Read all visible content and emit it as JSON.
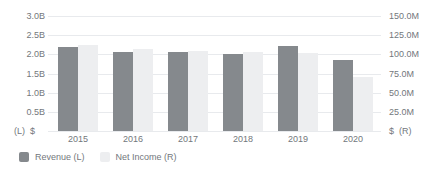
{
  "chart_data": {
    "type": "bar",
    "title": "",
    "categories": [
      "2015",
      "2016",
      "2017",
      "2018",
      "2019",
      "2020"
    ],
    "series": [
      {
        "name": "Revenue (L)",
        "axis": "left",
        "unit": "B",
        "values": [
          2.19,
          2.06,
          2.05,
          2.0,
          2.22,
          1.85
        ],
        "color": "#85898d"
      },
      {
        "name": "Net Income (R)",
        "axis": "right",
        "unit": "M",
        "values": [
          112,
          107,
          105,
          103,
          102,
          70
        ],
        "color": "#edeef0"
      }
    ],
    "left_axis": {
      "unit_label": "(L)  $",
      "ticks": [
        "3.0B",
        "2.5B",
        "2.0B",
        "1.5B",
        "1.0B",
        "0.5B"
      ],
      "min": 0,
      "max": 3.0
    },
    "right_axis": {
      "unit_label": "$  (R)",
      "ticks": [
        "150.0M",
        "125.0M",
        "100.0M",
        "75.0M",
        "50.0M",
        "25.0M"
      ],
      "min": 0,
      "max": 150
    },
    "grid": true,
    "legend_position": "bottom-left",
    "colors": {
      "grid": "#e8eaed",
      "text": "#73777c",
      "background": "#ffffff"
    }
  },
  "legend": {
    "items": [
      {
        "label": "Revenue (L)",
        "color": "#85898d"
      },
      {
        "label": "Net Income (R)",
        "color": "#edeef0"
      }
    ]
  }
}
